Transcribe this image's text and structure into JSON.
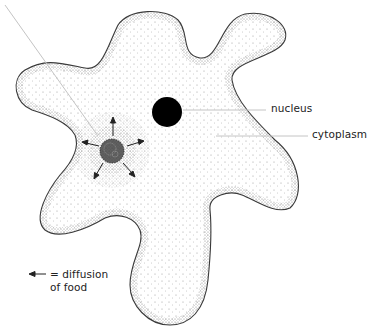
{
  "diagram": {
    "colors": {
      "outline": "#333333",
      "stipple": "#555555",
      "nucleus": "#000000",
      "leader_line": "#bbbbbb",
      "arrow": "#222222"
    },
    "labels": {
      "nucleus": "nucleus",
      "cytoplasm": "cytoplasm"
    },
    "legend": {
      "symbol": "arrow-left",
      "line1": "= diffusion",
      "line2": "of food"
    },
    "parts": [
      {
        "name": "cell-membrane",
        "type": "outline"
      },
      {
        "name": "nucleus",
        "type": "solid-circle"
      },
      {
        "name": "food-vacuole",
        "type": "stippled-circle",
        "arrows": 6
      },
      {
        "name": "cytoplasm",
        "type": "stipple-fill"
      }
    ]
  }
}
